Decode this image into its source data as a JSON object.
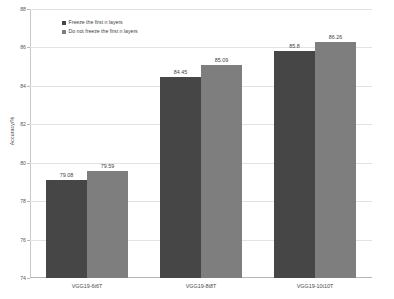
{
  "chart_data": {
    "type": "bar",
    "title": "",
    "xlabel": "",
    "ylabel": "Accuracy/%",
    "ylim": [
      74,
      88
    ],
    "ytick_step": 2,
    "yticks": [
      "88",
      "86",
      "84",
      "82",
      "80",
      "78",
      "76",
      "74"
    ],
    "grid": true,
    "legend_position": "top-left-inside",
    "categories": [
      "VGG19-6t6T",
      "VGG19-8t8T",
      "VGG19-10t10T"
    ],
    "series": [
      {
        "name": "Freeze the first n layers",
        "color": "#464646",
        "values": [
          79.08,
          84.45,
          85.8
        ],
        "labels": [
          "79.08",
          "84.45",
          "85.8"
        ]
      },
      {
        "name": "Do not freeze the first n layers",
        "color": "#7e7e7e",
        "values": [
          79.59,
          85.09,
          86.26
        ],
        "labels": [
          "79.59",
          "85.09",
          "86.26"
        ]
      }
    ]
  },
  "colors": {
    "series_dark": "#464646",
    "series_light": "#7e7e7e",
    "gridline": "#e3e3e3",
    "axis": "#b9b9b9",
    "text": "#3f3f3f",
    "background": "#ffffff"
  }
}
